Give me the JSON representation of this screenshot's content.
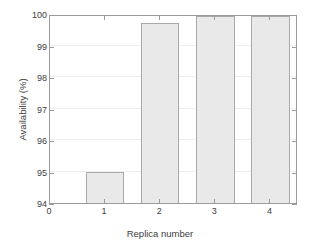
{
  "chart_data": {
    "type": "bar",
    "title": "",
    "xlabel": "Replica number",
    "ylabel": "Availability (%)",
    "categories": [
      "1",
      "2",
      "3",
      "4"
    ],
    "x": [
      1,
      2,
      3,
      4
    ],
    "values": [
      95.0,
      99.7,
      99.95,
      99.95
    ],
    "series": [
      {
        "name": "Availability",
        "values": [
          95.0,
          99.7,
          99.95,
          99.95
        ]
      }
    ],
    "xlim": [
      0,
      4.5
    ],
    "ylim": [
      94,
      100
    ],
    "xticks": [
      "0",
      "1",
      "2",
      "3",
      "4"
    ],
    "xtick_values": [
      0,
      1,
      2,
      3,
      4
    ],
    "yticks": [
      "94",
      "95",
      "96",
      "97",
      "98",
      "99",
      "100"
    ],
    "ytick_values": [
      94,
      95,
      96,
      97,
      98,
      99,
      100
    ],
    "grid": true,
    "grid_axis": "y",
    "legend": null,
    "legend_position": "none",
    "bar_fill_color": "#e9e9e9",
    "bar_edge_color": "#a9a9a9",
    "axes_color": "#9a9a9a",
    "grid_color": "#eeeeee",
    "background_color": "#ffffff",
    "text_color": "#3d3d3d",
    "bar_width_fraction": 0.7
  }
}
